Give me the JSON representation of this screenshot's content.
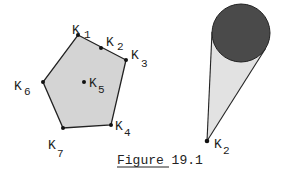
{
  "figure": {
    "caption": "Figure 19.1",
    "left": {
      "polygon_fill": "#d4d4d4",
      "stroke": "#222222",
      "points": [
        {
          "id": "K1",
          "letter": "K",
          "sub": "1",
          "x": 78,
          "y": 35,
          "lx": 72,
          "ly": 34,
          "sx": 84,
          "sy": 38
        },
        {
          "id": "K2",
          "letter": "K",
          "sub": "2",
          "x": 101,
          "y": 48,
          "lx": 106,
          "ly": 46,
          "sx": 117,
          "sy": 50
        },
        {
          "id": "K3",
          "letter": "K",
          "sub": "3",
          "x": 126,
          "y": 60,
          "lx": 131,
          "ly": 59,
          "sx": 141,
          "sy": 67
        },
        {
          "id": "K4",
          "letter": "K",
          "sub": "4",
          "x": 111,
          "y": 125,
          "lx": 115,
          "ly": 130,
          "sx": 124,
          "sy": 136
        },
        {
          "id": "K7",
          "letter": "K",
          "sub": "7",
          "x": 63,
          "y": 128,
          "lx": 48,
          "ly": 149,
          "sx": 57,
          "sy": 157
        },
        {
          "id": "K6",
          "letter": "K",
          "sub": "6",
          "x": 43,
          "y": 82,
          "lx": 14,
          "ly": 90,
          "sx": 24,
          "sy": 95
        },
        {
          "id": "K5",
          "letter": "K",
          "sub": "5",
          "x": 84,
          "y": 82,
          "lx": 89,
          "ly": 87,
          "sx": 98,
          "sy": 93
        }
      ]
    },
    "right": {
      "circle": {
        "cx": 241,
        "cy": 33,
        "r": 29,
        "fill": "#4a4a4a"
      },
      "cone_fill": "#e2e2e2",
      "apex": {
        "id": "K2",
        "letter": "K",
        "sub": "2",
        "x": 207,
        "y": 141,
        "lx": 214,
        "ly": 148,
        "sx": 223,
        "sy": 154
      }
    }
  }
}
